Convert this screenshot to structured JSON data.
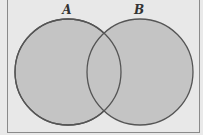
{
  "diagram": {
    "type": "venn",
    "sets": [
      {
        "label": "A",
        "cx": 68,
        "cy": 72,
        "r": 53
      },
      {
        "label": "B",
        "cx": 140,
        "cy": 72,
        "r": 53
      }
    ],
    "colors": {
      "fill": "#c4c4c4",
      "stroke": "#555555",
      "background": "#e8e8e8",
      "border": "#8a8a8a"
    }
  }
}
